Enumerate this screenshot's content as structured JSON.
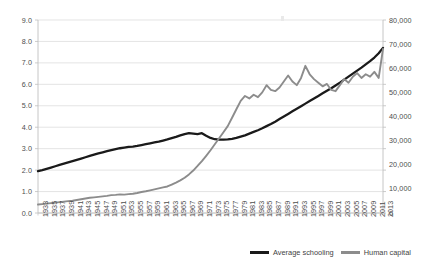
{
  "chart_data": {
    "type": "line",
    "title": "",
    "subtitle": "",
    "xlabel": "",
    "ylabel": "",
    "grid": true,
    "legend_position": "bottom-right",
    "x": [
      1933,
      1934,
      1935,
      1936,
      1937,
      1938,
      1939,
      1940,
      1941,
      1942,
      1943,
      1944,
      1945,
      1946,
      1947,
      1948,
      1949,
      1950,
      1951,
      1952,
      1953,
      1954,
      1955,
      1956,
      1957,
      1958,
      1959,
      1960,
      1961,
      1962,
      1963,
      1964,
      1965,
      1966,
      1967,
      1968,
      1969,
      1970,
      1971,
      1972,
      1973,
      1974,
      1975,
      1976,
      1977,
      1978,
      1979,
      1980,
      1981,
      1982,
      1983,
      1984,
      1985,
      1986,
      1987,
      1988,
      1989,
      1990,
      1991,
      1992,
      1993,
      1994,
      1995,
      1996,
      1997,
      1998,
      1999,
      2000,
      2001,
      2002,
      2003,
      2004,
      2005,
      2006,
      2007,
      2008,
      2009,
      2010,
      2011,
      2012,
      2013
    ],
    "x_tick_labels": [
      "1933",
      "1935",
      "1937",
      "1939",
      "1941",
      "1943",
      "1945",
      "1947",
      "1949",
      "1951",
      "1953",
      "1955",
      "1957",
      "1959",
      "1961",
      "1963",
      "1965",
      "1967",
      "1969",
      "1971",
      "1973",
      "1975",
      "1977",
      "1979",
      "1981",
      "1983",
      "1985",
      "1987",
      "1989",
      "1991",
      "1993",
      "1995",
      "1997",
      "1999",
      "2001",
      "2003",
      "2005",
      "2007",
      "2009",
      "2011",
      "2013"
    ],
    "axes": {
      "left": {
        "label": "",
        "ylim": [
          0.0,
          9.0
        ],
        "tick_step": 1.0,
        "tick_labels": [
          "0.0",
          "1.0",
          "2.0",
          "3.0",
          "4.0",
          "5.0",
          "6.0",
          "7.0",
          "8.0",
          "9.0"
        ]
      },
      "right": {
        "label": "",
        "ylim": [
          0,
          80000
        ],
        "tick_step": 10000,
        "tick_labels": [
          "0",
          "10,000",
          "20,000",
          "30,000",
          "40,000",
          "50,000",
          "60,000",
          "70,000",
          "80,000"
        ]
      }
    },
    "series": [
      {
        "name": "Average schooling",
        "axis": "left",
        "color": "#1a1a1a",
        "values": [
          1.95,
          2.0,
          2.06,
          2.12,
          2.18,
          2.24,
          2.3,
          2.36,
          2.42,
          2.48,
          2.54,
          2.6,
          2.66,
          2.72,
          2.78,
          2.83,
          2.88,
          2.93,
          2.98,
          3.02,
          3.05,
          3.08,
          3.1,
          3.13,
          3.17,
          3.21,
          3.25,
          3.29,
          3.33,
          3.38,
          3.43,
          3.49,
          3.55,
          3.62,
          3.68,
          3.72,
          3.7,
          3.68,
          3.72,
          3.6,
          3.5,
          3.44,
          3.42,
          3.42,
          3.43,
          3.46,
          3.5,
          3.56,
          3.62,
          3.7,
          3.78,
          3.86,
          3.95,
          4.05,
          4.15,
          4.26,
          4.38,
          4.5,
          4.62,
          4.74,
          4.86,
          4.98,
          5.1,
          5.22,
          5.34,
          5.46,
          5.58,
          5.7,
          5.82,
          5.95,
          6.08,
          6.22,
          6.36,
          6.5,
          6.64,
          6.78,
          6.93,
          7.08,
          7.25,
          7.45,
          7.7
        ]
      },
      {
        "name": "Human capital",
        "axis": "right",
        "color": "#8c8c8c",
        "values": [
          3500,
          3700,
          3900,
          4100,
          4300,
          4500,
          4700,
          4900,
          5100,
          5400,
          5700,
          6000,
          6300,
          6500,
          6700,
          6900,
          7100,
          7400,
          7500,
          7700,
          7600,
          7800,
          8000,
          8300,
          8700,
          9000,
          9400,
          9800,
          10200,
          10600,
          11000,
          11800,
          12600,
          13500,
          14600,
          16000,
          17600,
          19500,
          21500,
          23700,
          26000,
          28500,
          31000,
          33500,
          36000,
          39500,
          43000,
          46500,
          48500,
          47500,
          49000,
          48000,
          50000,
          53000,
          51000,
          50500,
          52000,
          54500,
          57000,
          54500,
          53000,
          56000,
          61000,
          57500,
          55500,
          54000,
          52500,
          53500,
          51000,
          50500,
          53000,
          55500,
          54000,
          56500,
          58000,
          56000,
          57500,
          56500,
          58500,
          56000,
          68000
        ]
      }
    ],
    "legend": [
      "Average schooling",
      "Human capital"
    ]
  },
  "colors": {
    "series_dark": "#1a1a1a",
    "series_gray": "#8c8c8c",
    "grid": "#d9d9d9",
    "axis": "#bfbfbf",
    "tick_text": "#4d4d4d"
  }
}
